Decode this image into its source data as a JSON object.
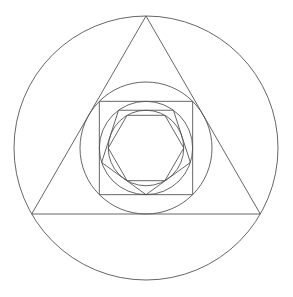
{
  "figure": {
    "background_color": "#ffffff",
    "stroke_color": "#555555",
    "stroke_width": 0.9,
    "width": 293,
    "height": 297,
    "center": {
      "x": 146,
      "y": 148
    }
  },
  "chart_data": {
    "type": "diagram",
    "center": {
      "x": 146,
      "y": 148
    },
    "sequence": [
      "circle-outer",
      "triangle",
      "circle-2",
      "square",
      "circle-3",
      "pentagon",
      "circle-4",
      "hexagon"
    ],
    "shapes": [
      {
        "id": "circle-outer",
        "name": "outer-circle",
        "kind": "circle",
        "cx": 146,
        "cy": 148,
        "r": 132,
        "stroke": "#555555"
      },
      {
        "id": "triangle",
        "name": "triangle",
        "kind": "polygon",
        "sides": 3,
        "cx": 146,
        "cy": 148,
        "circumradius": 132,
        "rotation_deg": -90,
        "vertices": [
          {
            "x": 146,
            "y": 16
          },
          {
            "x": 260.32,
            "y": 214
          },
          {
            "x": 31.68,
            "y": 214
          }
        ],
        "stroke": "#555555"
      },
      {
        "id": "circle-2",
        "name": "circle-in-triangle",
        "kind": "circle",
        "cx": 146,
        "cy": 148,
        "r": 66,
        "stroke": "#555555"
      },
      {
        "id": "square",
        "name": "square",
        "kind": "polygon",
        "sides": 4,
        "cx": 146,
        "cy": 148,
        "circumradius": 66,
        "rotation_deg": 45,
        "vertices": [
          {
            "x": 192.67,
            "y": 101.33
          },
          {
            "x": 192.67,
            "y": 194.67
          },
          {
            "x": 99.33,
            "y": 194.67
          },
          {
            "x": 99.33,
            "y": 101.33
          }
        ],
        "stroke": "#555555"
      },
      {
        "id": "circle-3",
        "name": "circle-in-square",
        "kind": "circle",
        "cx": 146,
        "cy": 148,
        "r": 46.67,
        "stroke": "#555555"
      },
      {
        "id": "pentagon",
        "name": "pentagon",
        "kind": "polygon",
        "sides": 5,
        "cx": 146,
        "cy": 148,
        "circumradius": 46.67,
        "rotation_deg": 90,
        "vertices": [
          {
            "x": 146,
            "y": 194.67
          },
          {
            "x": 101.62,
            "y": 180.25
          },
          {
            "x": 74.19,
            "y": 142.5
          },
          {
            "x": 117.81,
            "y": 142.5
          },
          {
            "x": 190.19,
            "y": 180.25
          }
        ],
        "stroke": "#555555"
      },
      {
        "id": "circle-4",
        "name": "circle-in-pentagon",
        "kind": "circle",
        "cx": 146,
        "cy": 148,
        "r": 37.75,
        "stroke": "#555555"
      },
      {
        "id": "hexagon",
        "name": "hexagon",
        "kind": "polygon",
        "sides": 6,
        "cx": 146,
        "cy": 148,
        "circumradius": 37.75,
        "rotation_deg": 0,
        "vertices": [
          {
            "x": 183.75,
            "y": 148
          },
          {
            "x": 164.88,
            "y": 180.69
          },
          {
            "x": 127.12,
            "y": 180.69
          },
          {
            "x": 108.25,
            "y": 148
          },
          {
            "x": 127.12,
            "y": 115.31
          },
          {
            "x": 164.88,
            "y": 115.31
          }
        ],
        "stroke": "#555555"
      }
    ]
  }
}
